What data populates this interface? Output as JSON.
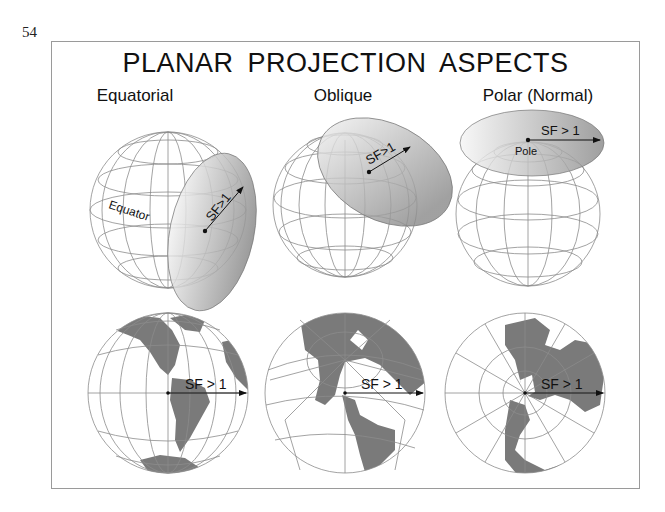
{
  "page": {
    "number": "54"
  },
  "figure": {
    "title": "PLANAR PROJECTION ASPECTS",
    "columns": [
      {
        "label": "Equatorial",
        "globe_labels": {
          "equator": "Equator",
          "scale_factor": "SF>1"
        },
        "map_label": "SF > 1"
      },
      {
        "label": "Oblique",
        "globe_labels": {
          "scale_factor": "SF>1"
        },
        "map_label": "SF > 1"
      },
      {
        "label": "Polar (Normal)",
        "globe_labels": {
          "pole": "Pole",
          "scale_factor": "SF > 1"
        },
        "map_label": "SF > 1"
      }
    ]
  },
  "colors": {
    "frame": "#9a9a9a",
    "graticule": "#8c8c8c",
    "land": "#7a7a7a",
    "plane_light": "#f0f0f0",
    "plane_dark": "#8e8e8e",
    "text": "#111111"
  }
}
